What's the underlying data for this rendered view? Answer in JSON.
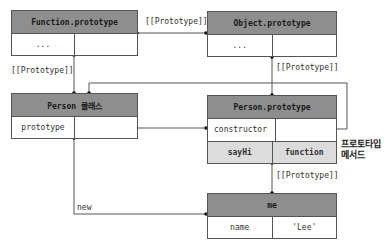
{
  "boxes": {
    "function_prototype": {
      "title": "Function.prototype",
      "rows": [
        [
          "...",
          ""
        ]
      ]
    },
    "object_prototype": {
      "title": "Object.prototype",
      "rows": [
        [
          "...",
          ""
        ]
      ]
    },
    "person_class": {
      "title": "Person 클래스",
      "rows": [
        [
          "prototype",
          ""
        ]
      ]
    },
    "person_prototype": {
      "title": "Person.prototype",
      "rows": [
        [
          "constructor",
          ""
        ],
        [
          "sayHi",
          "function"
        ]
      ]
    },
    "me": {
      "title": "me",
      "rows": [
        [
          "name",
          "'Lee'"
        ]
      ]
    }
  },
  "labels": {
    "proto_fn_to_obj": "[[Prototype]]",
    "proto_person_to_fn": "[[Prototype]]",
    "proto_personproto_to_obj": "[[Prototype]]",
    "proto_me_to_personproto": "[[Prototype]]",
    "new": "new",
    "prototype_method_line1": "프로토타입",
    "prototype_method_line2": "메서드"
  },
  "colors": {
    "header": "#8e8e8e",
    "light_row": "#dcdcdc",
    "line": "#555555"
  }
}
